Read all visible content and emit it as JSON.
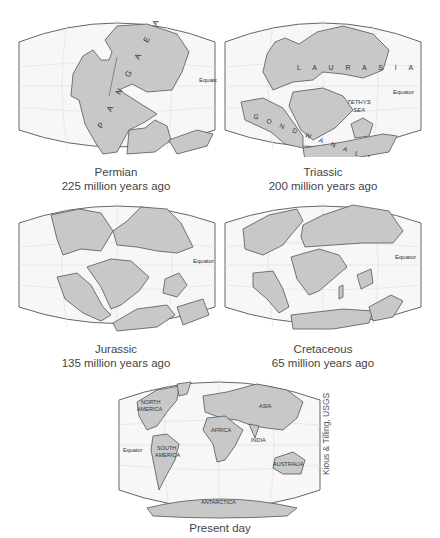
{
  "figure": {
    "panels": [
      {
        "id": "permian",
        "period": "Permian",
        "age": "225 million years ago",
        "labels": {
          "supercontinent": "P A N G A E A",
          "equator": "Equator"
        }
      },
      {
        "id": "triassic",
        "period": "Triassic",
        "age": "200 million years ago",
        "labels": {
          "north": "L A U R A S I A",
          "south": "G O N D W A N A L A N D",
          "sea_line1": "TETHYS",
          "sea_line2": "SEA",
          "equator": "Equator"
        }
      },
      {
        "id": "jurassic",
        "period": "Jurassic",
        "age": "135 million years ago",
        "labels": {
          "equator": "Equator"
        }
      },
      {
        "id": "cretaceous",
        "period": "Cretaceous",
        "age": "65 million years ago",
        "labels": {
          "equator": "Equator"
        }
      },
      {
        "id": "present",
        "period": "Present day",
        "labels": {
          "north_america_1": "NORTH",
          "north_america_2": "AMERICA",
          "south_america_1": "SOUTH",
          "south_america_2": "AMERICA",
          "africa": "AFRICA",
          "asia": "ASIA",
          "india": "INDIA",
          "australia": "AUSTRALIA",
          "antarctica": "ANTARCTICA",
          "equator": "Equator"
        }
      }
    ],
    "credit": "Kious & Tilling, USGS",
    "colors": {
      "land": "#c8c8c8",
      "land_stroke": "#555555",
      "ocean": "#f7f7f7",
      "grid": "#dddddd",
      "frame": "#666666"
    }
  }
}
